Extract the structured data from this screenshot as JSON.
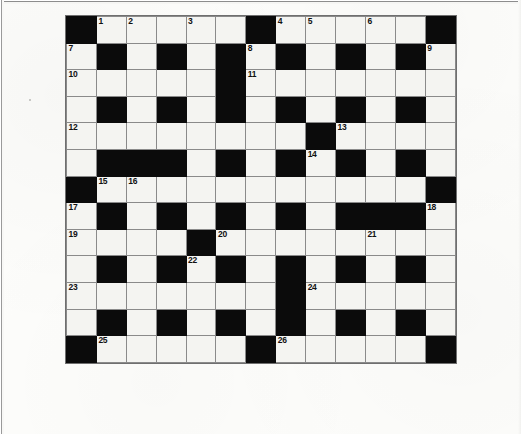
{
  "document": {
    "type": "crossword-puzzle-grid",
    "title": "Crossword Puzzle",
    "media": "scanned newspaper page"
  },
  "grid": {
    "columns": 13,
    "rows": 15,
    "cell_color_white": "#f4f4f1",
    "cell_color_black": "#0b0b0b",
    "grid_line_color": "#8a8a8a",
    "clue_number_color": "#111111",
    "rows_data": [
      {
        "index": 1,
        "cells": [
          {
            "type": "black",
            "num": ""
          },
          {
            "type": "white",
            "num": "1"
          },
          {
            "type": "white",
            "num": "2"
          },
          {
            "type": "white",
            "num": ""
          },
          {
            "type": "white",
            "num": "3"
          },
          {
            "type": "white",
            "num": ""
          },
          {
            "type": "black",
            "num": ""
          },
          {
            "type": "white",
            "num": "4"
          },
          {
            "type": "white",
            "num": "5"
          },
          {
            "type": "white",
            "num": ""
          },
          {
            "type": "white",
            "num": "6"
          },
          {
            "type": "white",
            "num": ""
          },
          {
            "type": "black",
            "num": ""
          }
        ]
      },
      {
        "index": 2,
        "cells": [
          {
            "type": "white",
            "num": "7"
          },
          {
            "type": "black",
            "num": ""
          },
          {
            "type": "white",
            "num": ""
          },
          {
            "type": "black",
            "num": ""
          },
          {
            "type": "white",
            "num": ""
          },
          {
            "type": "black",
            "num": ""
          },
          {
            "type": "white",
            "num": "8"
          },
          {
            "type": "black",
            "num": ""
          },
          {
            "type": "white",
            "num": ""
          },
          {
            "type": "black",
            "num": ""
          },
          {
            "type": "white",
            "num": ""
          },
          {
            "type": "black",
            "num": ""
          },
          {
            "type": "white",
            "num": "9"
          }
        ]
      },
      {
        "index": 3,
        "cells": [
          {
            "type": "white",
            "num": "10"
          },
          {
            "type": "white",
            "num": ""
          },
          {
            "type": "white",
            "num": ""
          },
          {
            "type": "white",
            "num": ""
          },
          {
            "type": "white",
            "num": ""
          },
          {
            "type": "black",
            "num": ""
          },
          {
            "type": "white",
            "num": "11"
          },
          {
            "type": "white",
            "num": ""
          },
          {
            "type": "white",
            "num": ""
          },
          {
            "type": "white",
            "num": ""
          },
          {
            "type": "white",
            "num": ""
          },
          {
            "type": "white",
            "num": ""
          },
          {
            "type": "white",
            "num": ""
          }
        ]
      },
      {
        "index": 4,
        "cells": [
          {
            "type": "white",
            "num": ""
          },
          {
            "type": "black",
            "num": ""
          },
          {
            "type": "white",
            "num": ""
          },
          {
            "type": "black",
            "num": ""
          },
          {
            "type": "white",
            "num": ""
          },
          {
            "type": "black",
            "num": ""
          },
          {
            "type": "white",
            "num": ""
          },
          {
            "type": "black",
            "num": ""
          },
          {
            "type": "white",
            "num": ""
          },
          {
            "type": "black",
            "num": ""
          },
          {
            "type": "white",
            "num": ""
          },
          {
            "type": "black",
            "num": ""
          },
          {
            "type": "white",
            "num": ""
          }
        ]
      },
      {
        "index": 5,
        "cells": [
          {
            "type": "white",
            "num": "12"
          },
          {
            "type": "white",
            "num": ""
          },
          {
            "type": "white",
            "num": ""
          },
          {
            "type": "white",
            "num": ""
          },
          {
            "type": "white",
            "num": ""
          },
          {
            "type": "white",
            "num": ""
          },
          {
            "type": "white",
            "num": ""
          },
          {
            "type": "white",
            "num": ""
          },
          {
            "type": "black",
            "num": ""
          },
          {
            "type": "white",
            "num": "13"
          },
          {
            "type": "white",
            "num": ""
          },
          {
            "type": "white",
            "num": ""
          },
          {
            "type": "white",
            "num": ""
          }
        ]
      },
      {
        "index": 6,
        "cells": [
          {
            "type": "white",
            "num": ""
          },
          {
            "type": "black",
            "num": ""
          },
          {
            "type": "black",
            "num": ""
          },
          {
            "type": "black",
            "num": ""
          },
          {
            "type": "white",
            "num": ""
          },
          {
            "type": "black",
            "num": ""
          },
          {
            "type": "white",
            "num": ""
          },
          {
            "type": "black",
            "num": ""
          },
          {
            "type": "white",
            "num": "14"
          },
          {
            "type": "black",
            "num": ""
          },
          {
            "type": "white",
            "num": ""
          },
          {
            "type": "black",
            "num": ""
          },
          {
            "type": "white",
            "num": ""
          }
        ]
      },
      {
        "index": 7,
        "cells": [
          {
            "type": "black",
            "num": ""
          },
          {
            "type": "white",
            "num": "15"
          },
          {
            "type": "white",
            "num": "16"
          },
          {
            "type": "white",
            "num": ""
          },
          {
            "type": "white",
            "num": ""
          },
          {
            "type": "white",
            "num": ""
          },
          {
            "type": "white",
            "num": ""
          },
          {
            "type": "white",
            "num": ""
          },
          {
            "type": "white",
            "num": ""
          },
          {
            "type": "white",
            "num": ""
          },
          {
            "type": "white",
            "num": ""
          },
          {
            "type": "white",
            "num": ""
          },
          {
            "type": "black",
            "num": ""
          }
        ]
      },
      {
        "index": 8,
        "cells": [
          {
            "type": "white",
            "num": "17"
          },
          {
            "type": "black",
            "num": ""
          },
          {
            "type": "white",
            "num": ""
          },
          {
            "type": "black",
            "num": ""
          },
          {
            "type": "white",
            "num": ""
          },
          {
            "type": "black",
            "num": ""
          },
          {
            "type": "white",
            "num": ""
          },
          {
            "type": "black",
            "num": ""
          },
          {
            "type": "white",
            "num": ""
          },
          {
            "type": "black",
            "num": ""
          },
          {
            "type": "black",
            "num": ""
          },
          {
            "type": "black",
            "num": ""
          },
          {
            "type": "white",
            "num": "18"
          }
        ]
      },
      {
        "index": 9,
        "cells": [
          {
            "type": "white",
            "num": "19"
          },
          {
            "type": "white",
            "num": ""
          },
          {
            "type": "white",
            "num": ""
          },
          {
            "type": "white",
            "num": ""
          },
          {
            "type": "black",
            "num": ""
          },
          {
            "type": "white",
            "num": "20"
          },
          {
            "type": "white",
            "num": ""
          },
          {
            "type": "white",
            "num": ""
          },
          {
            "type": "white",
            "num": ""
          },
          {
            "type": "white",
            "num": ""
          },
          {
            "type": "white",
            "num": "21"
          },
          {
            "type": "white",
            "num": ""
          },
          {
            "type": "white",
            "num": ""
          }
        ]
      },
      {
        "index": 10,
        "cells": [
          {
            "type": "white",
            "num": ""
          },
          {
            "type": "black",
            "num": ""
          },
          {
            "type": "white",
            "num": ""
          },
          {
            "type": "black",
            "num": ""
          },
          {
            "type": "white",
            "num": "22"
          },
          {
            "type": "black",
            "num": ""
          },
          {
            "type": "white",
            "num": ""
          },
          {
            "type": "black",
            "num": ""
          },
          {
            "type": "white",
            "num": ""
          },
          {
            "type": "black",
            "num": ""
          },
          {
            "type": "white",
            "num": ""
          },
          {
            "type": "black",
            "num": ""
          },
          {
            "type": "white",
            "num": ""
          }
        ]
      },
      {
        "index": 11,
        "cells": [
          {
            "type": "white",
            "num": "23"
          },
          {
            "type": "white",
            "num": ""
          },
          {
            "type": "white",
            "num": ""
          },
          {
            "type": "white",
            "num": ""
          },
          {
            "type": "white",
            "num": ""
          },
          {
            "type": "white",
            "num": ""
          },
          {
            "type": "white",
            "num": ""
          },
          {
            "type": "black",
            "num": ""
          },
          {
            "type": "white",
            "num": "24"
          },
          {
            "type": "white",
            "num": ""
          },
          {
            "type": "white",
            "num": ""
          },
          {
            "type": "white",
            "num": ""
          },
          {
            "type": "white",
            "num": ""
          }
        ]
      },
      {
        "index": 12,
        "cells": [
          {
            "type": "white",
            "num": ""
          },
          {
            "type": "black",
            "num": ""
          },
          {
            "type": "white",
            "num": ""
          },
          {
            "type": "black",
            "num": ""
          },
          {
            "type": "white",
            "num": ""
          },
          {
            "type": "black",
            "num": ""
          },
          {
            "type": "white",
            "num": ""
          },
          {
            "type": "black",
            "num": ""
          },
          {
            "type": "white",
            "num": ""
          },
          {
            "type": "black",
            "num": ""
          },
          {
            "type": "white",
            "num": ""
          },
          {
            "type": "black",
            "num": ""
          },
          {
            "type": "white",
            "num": ""
          }
        ]
      },
      {
        "index": 13,
        "cells": [
          {
            "type": "black",
            "num": ""
          },
          {
            "type": "white",
            "num": "25"
          },
          {
            "type": "white",
            "num": ""
          },
          {
            "type": "white",
            "num": ""
          },
          {
            "type": "white",
            "num": ""
          },
          {
            "type": "white",
            "num": ""
          },
          {
            "type": "black",
            "num": ""
          },
          {
            "type": "white",
            "num": "26"
          },
          {
            "type": "white",
            "num": ""
          },
          {
            "type": "white",
            "num": ""
          },
          {
            "type": "white",
            "num": ""
          },
          {
            "type": "white",
            "num": ""
          },
          {
            "type": "black",
            "num": ""
          }
        ]
      }
    ]
  },
  "clue_numbers_visible": [
    "1",
    "2",
    "3",
    "4",
    "5",
    "6",
    "7",
    "8",
    "9",
    "10",
    "11",
    "12",
    "13",
    "14",
    "15",
    "16",
    "17",
    "18",
    "19",
    "20",
    "21",
    "22",
    "23",
    "24",
    "25",
    "26"
  ],
  "bleed_through": {
    "left": "",
    "right": ""
  }
}
